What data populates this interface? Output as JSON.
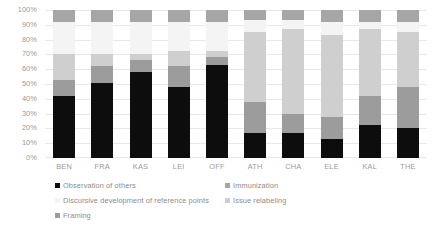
{
  "chart_data": {
    "type": "bar",
    "subtype": "100% stacked column",
    "title": "",
    "subtitle": "",
    "xlabel": "",
    "ylabel": "",
    "ylim": [
      0,
      100
    ],
    "yunit": "%",
    "grid": true,
    "legend_position": "bottom",
    "categories": [
      "BEN",
      "FRA",
      "KAS",
      "LEI",
      "OFF",
      "ATH",
      "CHA",
      "ELE",
      "KAL",
      "THE"
    ],
    "y_ticks": [
      "0%",
      "10%",
      "20%",
      "30%",
      "40%",
      "50%",
      "60%",
      "70%",
      "80%",
      "90%",
      "100%"
    ],
    "y_tick_values": [
      0,
      10,
      20,
      30,
      40,
      50,
      60,
      70,
      80,
      90,
      100
    ],
    "series": [
      {
        "name": "Observation of others",
        "color": "#0d0d0d",
        "values": [
          42,
          51,
          58,
          48,
          63,
          17,
          17,
          13,
          22,
          20
        ]
      },
      {
        "name": "Framing",
        "color": "#9c9c9c",
        "values": [
          11,
          11,
          8,
          14,
          5,
          21,
          13,
          15,
          20,
          28
        ]
      },
      {
        "name": "Issue relabeling",
        "color": "#cfcfcf",
        "values": [
          17,
          8,
          4,
          10,
          4,
          47,
          57,
          55,
          45,
          37
        ]
      },
      {
        "name": "Discursive development of reference points",
        "color": "#f4f4f4",
        "values": [
          22,
          22,
          22,
          20,
          20,
          8,
          6,
          9,
          5,
          7
        ]
      },
      {
        "name": "Immunization",
        "color": "#a6a6a6",
        "values": [
          8,
          8,
          8,
          8,
          8,
          7,
          7,
          8,
          8,
          8
        ]
      }
    ]
  }
}
